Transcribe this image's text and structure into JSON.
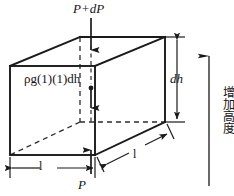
{
  "figure": {
    "background_color": "#ffffff",
    "line_color": "#1a1a1a",
    "dashed_color": "#2b2b2b"
  },
  "labels": {
    "top_force": "P+dP",
    "weight": "ρg(1)(1)dh",
    "height_dim": "dh",
    "bottom_force": "P",
    "width_dim": "l",
    "depth_dim": "l",
    "axis_caption": "增加高度"
  },
  "geometry": {
    "front_face": {
      "top_left": [
        10,
        66
      ],
      "top_right": [
        95,
        66
      ],
      "bottom_right": [
        95,
        155
      ],
      "bottom_left": [
        10,
        155
      ]
    },
    "back_face": {
      "top_left": [
        80,
        37
      ],
      "top_right": [
        165,
        37
      ],
      "bottom_right": [
        165,
        122
      ],
      "bottom_left": [
        80,
        122
      ]
    },
    "hidden_edges": [
      "back_bottom_left_vertical",
      "back_bottom_left_to_front",
      "back_bottom_to_right"
    ]
  },
  "arrows": {
    "top": {
      "direction": "down",
      "from": [
        91,
        18
      ],
      "to": [
        91,
        52
      ]
    },
    "weight": {
      "direction": "down",
      "from": [
        91,
        86
      ],
      "to": [
        91,
        110
      ],
      "has_dot": true
    },
    "bottom": {
      "direction": "up",
      "from": [
        91,
        172
      ],
      "to": [
        91,
        148
      ]
    },
    "height_dim": {
      "direction": "both",
      "x": 177,
      "from_y": 38,
      "to_y": 122
    },
    "width_dim": {
      "direction": "both",
      "y": 168,
      "from_x": 10,
      "to_x": 95
    },
    "depth_dim": {
      "direction": "both",
      "from": [
        106,
        163
      ],
      "to": [
        166,
        131
      ]
    },
    "axis": {
      "direction": "up",
      "from": [
        209,
        186
      ],
      "to": [
        209,
        54
      ]
    }
  }
}
